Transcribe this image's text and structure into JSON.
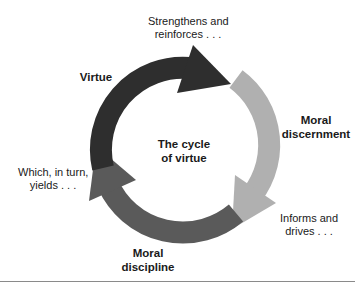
{
  "diagram": {
    "title_line1": "The cycle",
    "title_line2": "of virtue",
    "stages": [
      {
        "name": "Virtue",
        "line1": "Virtue",
        "line2": "",
        "color": "#2e2e2e"
      },
      {
        "name": "Moral discernment",
        "line1": "Moral",
        "line2": "discernment",
        "color": "#b0b0b0"
      },
      {
        "name": "Moral discipline",
        "line1": "Moral",
        "line2": "discipline",
        "color": "#5a5a5a"
      }
    ],
    "transitions": [
      {
        "line1": "Strengthens and",
        "line2": "reinforces . . ."
      },
      {
        "line1": "Informs and",
        "line2": "drives . . ."
      },
      {
        "line1": "Which, in turn,",
        "line2": "yields . . ."
      }
    ]
  }
}
